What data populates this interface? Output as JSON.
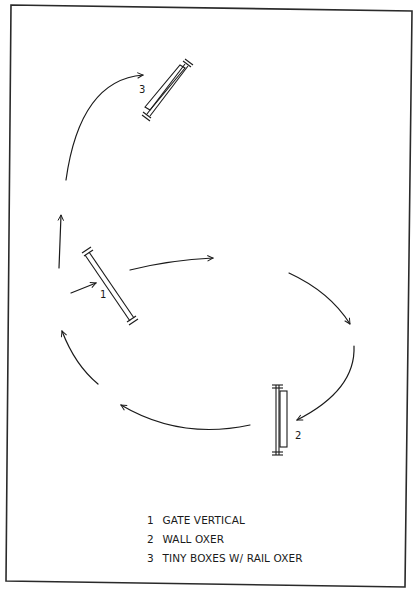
{
  "diagram": {
    "colors": {
      "line": "#1a1a1a",
      "background": "#ffffff",
      "border": "#2a2a2a"
    },
    "jumps": [
      {
        "number": "1",
        "name": "GATE VERTICAL",
        "type": "vertical"
      },
      {
        "number": "2",
        "name": "WALL OXER",
        "type": "oxer"
      },
      {
        "number": "3",
        "name": "TINY BOXES W/ RAIL OXER",
        "type": "oxer"
      }
    ],
    "legend": [
      {
        "number": "1",
        "label": "GATE VERTICAL"
      },
      {
        "number": "2",
        "label": "WALL OXER"
      },
      {
        "number": "3",
        "label": "TINY BOXES W/ RAIL OXER"
      }
    ]
  }
}
